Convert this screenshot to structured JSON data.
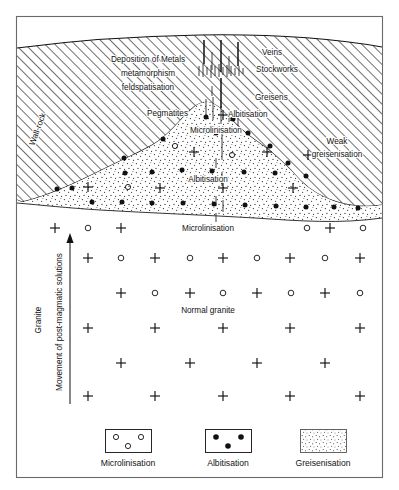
{
  "figure": {
    "type": "geological-cross-section",
    "frame": {
      "x": 16,
      "y": 16,
      "width": 367,
      "height": 462,
      "border_color": "#6a6a6a"
    }
  },
  "labels": {
    "wall_rock": "Wall-rock",
    "deposition_line1": "Deposition of Metals",
    "deposition_line2": "metamorphism",
    "deposition_line3": "feldspatisation",
    "veins": "Veins",
    "stockworks": "Stockworks",
    "greisens": "Greisens",
    "pegmatites": "Pegmatites",
    "albitisation_cupola": "Albitisation",
    "microlinisation_cupola": "Microlinisation",
    "weak_line1": "Weak",
    "weak_line2": "greisenisation",
    "albitisation_zone": "Albitisation",
    "microlinisation_zone": "Microlinisation",
    "normal_granite": "Normal granite",
    "granite": "Granite",
    "movement": "Movement of post-magmatic solutions"
  },
  "legend": {
    "items": [
      {
        "key": "microlinisation",
        "label": "Microlinisation",
        "symbol": "open-circles"
      },
      {
        "key": "albitisation",
        "label": "Albitisation",
        "symbol": "filled-dots"
      },
      {
        "key": "greisenisation",
        "label": "Greisenisation",
        "symbol": "stipple"
      }
    ]
  },
  "colors": {
    "ink": "#111111",
    "frame": "#6a6a6a",
    "paper": "#ffffff",
    "hatch": "#1a1a1a",
    "stipple": "#2a2a2a"
  }
}
